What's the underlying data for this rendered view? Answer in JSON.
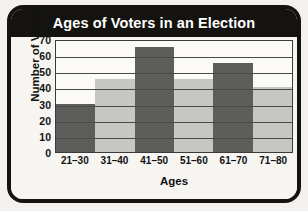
{
  "chart_data": {
    "type": "bar",
    "title": "Ages of Voters in an Election",
    "xlabel": "Ages",
    "ylabel": "Number of Voters",
    "categories": [
      "21–30",
      "31–40",
      "41–50",
      "51–60",
      "61–70",
      "71–80"
    ],
    "values": [
      30,
      45,
      65,
      45,
      55,
      40
    ],
    "bar_colors": [
      "#5d5d5b",
      "#c6c6c2",
      "#5d5d5b",
      "#c6c6c2",
      "#5d5d5b",
      "#c6c6c2"
    ],
    "ylim": [
      0,
      70
    ],
    "yticks": [
      0,
      10,
      20,
      30,
      40,
      50,
      60,
      70
    ],
    "ytick_labels": [
      "0",
      "10",
      "20",
      "30",
      "40",
      "50",
      "60",
      "70"
    ],
    "gridlines": [
      10,
      20,
      30,
      40,
      50,
      60
    ],
    "grid": true,
    "legend": null,
    "legend_position": "none",
    "series": [
      {
        "name": "Number of Voters",
        "values": [
          30,
          45,
          65,
          45,
          55,
          40
        ]
      }
    ]
  },
  "card": {
    "title_bar_color": "#15130f",
    "title_text_color": "#ffffff",
    "background_color": "#f6f5f1",
    "border_color": "#15130f",
    "plot_border_color": "#3a3a38",
    "gridline_color": "#4a4a48",
    "axis_text_color": "#111111"
  }
}
